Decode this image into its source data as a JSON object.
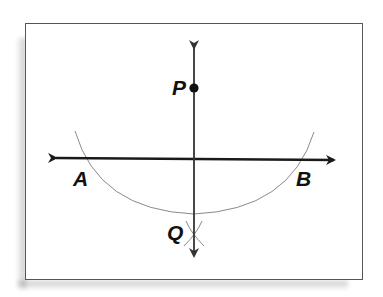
{
  "figure": {
    "type": "perpendicular-construction",
    "labels": {
      "P": "P",
      "Q": "Q",
      "A": "A",
      "B": "B"
    },
    "colors": {
      "line": "#1a1a1a",
      "vertical_line": "#333333",
      "arc": "#8a8a8a",
      "frame_border": "#555555",
      "point": "#111111"
    }
  }
}
